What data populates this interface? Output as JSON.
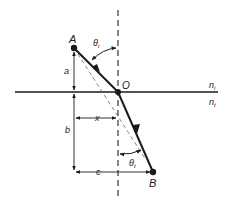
{
  "diagram": {
    "type": "refraction-geometry",
    "points": {
      "A": {
        "label": "A"
      },
      "O": {
        "label": "O"
      },
      "B": {
        "label": "B"
      }
    },
    "media": {
      "incident": "n",
      "incident_sub": "i",
      "transmitted": "n",
      "transmitted_sub": "t"
    },
    "angles": {
      "incident": "θ",
      "incident_sub": "i",
      "transmitted": "θ",
      "transmitted_sub": "t"
    },
    "dimensions": {
      "a": "a",
      "b": "b",
      "x": "x",
      "c": "c"
    },
    "colors": {
      "line": "#1a1a1a",
      "dashed": "#555555",
      "background": "#ffffff"
    }
  }
}
